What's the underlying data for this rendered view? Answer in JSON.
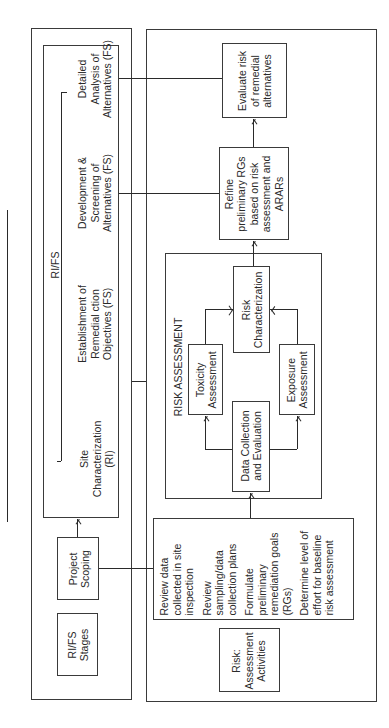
{
  "rifs_panel": {
    "group_label": "RI/FS",
    "stages_label": "RI/FS\nStages",
    "project_scoping": "Project\nScoping",
    "stages": [
      {
        "label": "Site\nCharacterization\n(RI)"
      },
      {
        "label": "Establishment of\nRemedial ction\nObjectives (FS)"
      },
      {
        "label": "Development &\nScreening of\nAlternatives (FS)"
      },
      {
        "label": "Detailed\nAnalysis of\nAlternatives (FS)"
      }
    ]
  },
  "risk_panel": {
    "activities_label": "Risk:\nAssessment\nActivities",
    "scoping_activities": [
      "Review data\ncollected in site\ninspection",
      "Review\nsampling/data\ncollection plans",
      "Formulate\npreliminary\nremediation goals\n(RGs)",
      "Determine level of\neffort for baseline\nrisk assessment"
    ],
    "risk_assessment": {
      "title": "RISK ASSESSMENT",
      "data_collection": "Data Collection\nand Evaluation",
      "toxicity": "Toxicity\nAssessment",
      "exposure": "Exposure\nAssessment",
      "characterization": "Risk\nCharacterization"
    },
    "refine": "Refine\npreliminary RGs\nbased on risk\nassessment and\nARARs",
    "evaluate": "Evaluate risk\nof remedial\nalternatives"
  }
}
